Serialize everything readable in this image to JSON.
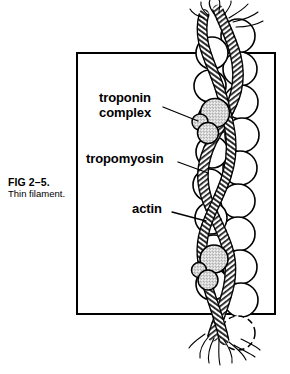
{
  "figure": {
    "caption": {
      "number": "FIG 2–5.",
      "title": "Thin filament."
    },
    "frame": {
      "border_color": "#000000",
      "border_width_px": 2
    },
    "labels": [
      {
        "id": "troponin-complex",
        "line1": "troponin",
        "line2": "complex",
        "leader": "line from label to the shaded globular cluster on the filament"
      },
      {
        "id": "tropomyosin",
        "line1": "tropomyosin",
        "line2": "",
        "leader": "line from label to the twisted rope strand winding along the filament"
      },
      {
        "id": "actin",
        "line1": "actin",
        "line2": "",
        "leader": "line from label to one of the outlined spheres in the bead chain"
      }
    ],
    "illustration": {
      "subject": "thin filament",
      "description": "Double helical chain of globular actin monomers with two tropomyosin strands coiled around it and troponin complexes attached; both ends of the filament are drawn frayed/broken.",
      "ink_color": "#000000",
      "sphere_fill": "#ffffff",
      "troponin_shading": "#d8d8d8",
      "tropomyosin_shading": "#9a9a9a",
      "actin_bead_count": 22,
      "troponin_complex_count": 2,
      "tropomyosin_strand_count": 2
    }
  }
}
